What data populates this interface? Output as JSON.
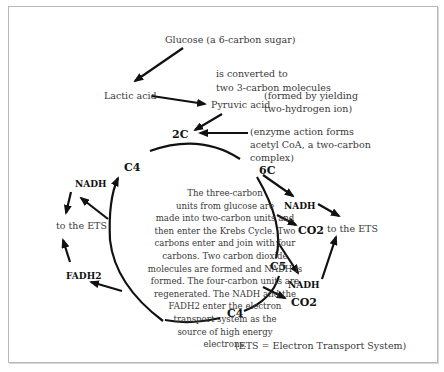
{
  "diagram": {
    "top": {
      "glucose": "Glucose (a 6-carbon sugar)",
      "converted_line1": "is converted to",
      "converted_line2": "two 3-carbon molecules",
      "lactic_acid": "Lactic acid",
      "pyruvic_acid": "Pyruvic acid",
      "pyruvic_note_line1": "(formed by yielding",
      "pyruvic_note_line2": "two-hydrogen ion)",
      "enzyme_line1": "(enzyme action forms",
      "enzyme_line2": "acetyl CoA, a two-carbon",
      "enzyme_line3": "complex)"
    },
    "cycle_nodes": {
      "two_c": "2C",
      "six_c": "6C",
      "c5": "C5",
      "c4_bottom": "C4",
      "c4_left": "C4"
    },
    "products": {
      "nadh_1": "NADH",
      "co2_1": "CO2",
      "nadh_2": "NADH",
      "co2_2": "CO2",
      "nadh_left": "NADH",
      "fadh2": "FADH2",
      "ets_right": "to the ETS",
      "ets_left": "to the ETS"
    },
    "center_text": [
      "The three-carbon",
      "units from glucose are",
      "made into two-carbon units and",
      "then enter the Krebs Cycle.  Two",
      "carbons enter and join with four",
      "carbons.  Two carbon dioxide",
      "molecules are formed and NADH is",
      "formed.  The four-carbon units are",
      "regenerated.  The NADH and the",
      "FADH2 enter the electron",
      "transport system as the",
      "source of high energy",
      "electrons."
    ],
    "footnote": "(ETS = Electron Transport System)",
    "colors": {
      "ink": "#111111",
      "text": "#3a3a3a",
      "frame": "#b8b8b8"
    }
  }
}
